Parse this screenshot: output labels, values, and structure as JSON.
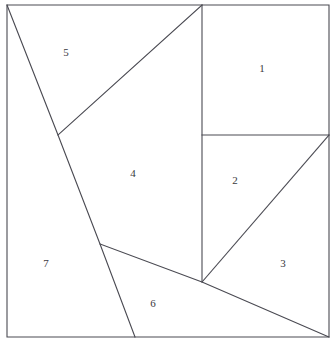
{
  "figure": {
    "canvas": {
      "width": 333,
      "height": 346
    },
    "colors": {
      "background": "#ffffff",
      "stroke": "#4a4a52",
      "label_text": "#3a3a40"
    },
    "stroke_width": 1.1,
    "square": {
      "name": "outer-square",
      "points": "7,5 329,5 329,337 7,337",
      "corners": {
        "top_left": [
          7,
          5
        ],
        "top_right": [
          329,
          5
        ],
        "bottom_right": [
          329,
          337
        ],
        "bottom_left": [
          7,
          337
        ]
      }
    },
    "vertices": {
      "top_left_corner": [
        7,
        5
      ],
      "top_right_corner": [
        329,
        5
      ],
      "bottom_right_corner": [
        329,
        337
      ],
      "bottom_left_corner": [
        7,
        337
      ],
      "top_junction": [
        202,
        5
      ],
      "left_upper_junction": [
        58,
        135
      ],
      "right_mid_junction": [
        329,
        135
      ],
      "inner_horizontal_left": [
        202,
        135
      ],
      "center_junction": [
        202,
        282
      ],
      "left_lower_junction": [
        100,
        244
      ],
      "bottom_diagonal_foot": [
        135,
        337
      ]
    },
    "cuts": [
      {
        "name": "vertical-cut",
        "description": "vertical segment separating regions 1 and 2 from region 4",
        "from": [
          202,
          5
        ],
        "to": [
          202,
          282
        ]
      },
      {
        "name": "horizontal-cut",
        "description": "horizontal segment separating region 1 from regions 2 and 3",
        "from": [
          202,
          135
        ],
        "to": [
          329,
          135
        ]
      },
      {
        "name": "region5-diagonal-cut",
        "description": "diagonal from top junction down-left, lower edge of region 5",
        "from": [
          202,
          5
        ],
        "to": [
          58,
          135
        ]
      },
      {
        "name": "long-left-diagonal-cut",
        "description": "long diagonal from top-left corner to bottom edge, boundary of region 7",
        "points": "7,5 58,135 100,244 135,337"
      },
      {
        "name": "region6-lower-diagonal-cut",
        "description": "diagonal from left lower junction through centre to bottom-right corner",
        "points": "100,244 202,282 329,337"
      },
      {
        "name": "region2-3-diagonal-cut",
        "description": "diagonal separating region 2 from region 3",
        "from": [
          202,
          282
        ],
        "to": [
          329,
          135
        ]
      }
    ],
    "labels": [
      {
        "name": "region-label-1",
        "text": "1",
        "x": 262,
        "y": 68
      },
      {
        "name": "region-label-2",
        "text": "2",
        "x": 235,
        "y": 180
      },
      {
        "name": "region-label-3",
        "text": "3",
        "x": 283,
        "y": 263
      },
      {
        "name": "region-label-4",
        "text": "4",
        "x": 133,
        "y": 173
      },
      {
        "name": "region-label-5",
        "text": "5",
        "x": 66,
        "y": 52
      },
      {
        "name": "region-label-6",
        "text": "6",
        "x": 153,
        "y": 303
      },
      {
        "name": "region-label-7",
        "text": "7",
        "x": 46,
        "y": 263
      }
    ]
  }
}
